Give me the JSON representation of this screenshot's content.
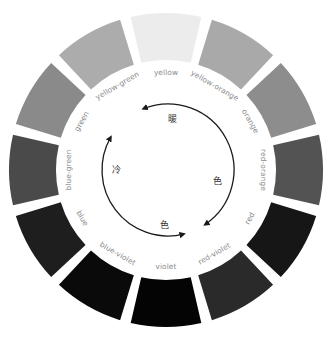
{
  "diagram": {
    "center": [
      166,
      170
    ],
    "outer_radius": 157,
    "inner_radius": 110,
    "label_radius": 97,
    "gap_degrees": 4,
    "segments": [
      {
        "name": "yellow",
        "label": "yellow",
        "color": "#ececec"
      },
      {
        "name": "yellow-orange",
        "label": "yellow-orange",
        "color": "#a9a9a9"
      },
      {
        "name": "orange",
        "label": "orange",
        "color": "#8d8d8d"
      },
      {
        "name": "red-orange",
        "label": "red-orange",
        "color": "#535353"
      },
      {
        "name": "red",
        "label": "red",
        "color": "#161616"
      },
      {
        "name": "red-violet",
        "label": "red-violet",
        "color": "#2a2a2a"
      },
      {
        "name": "violet",
        "label": "violet",
        "color": "#040404"
      },
      {
        "name": "blue-violet",
        "label": "blue-violet",
        "color": "#0a0a0a"
      },
      {
        "name": "blue",
        "label": "blue",
        "color": "#1e1e1e"
      },
      {
        "name": "blue-green",
        "label": "blue-green",
        "color": "#4a4a4a"
      },
      {
        "name": "green",
        "label": "green",
        "color": "#8a8a8a"
      },
      {
        "name": "yellow-green",
        "label": "yellow-green",
        "color": "#acacac"
      }
    ],
    "arrows": {
      "radius": 66,
      "warm": {
        "label_chars": [
          "暖",
          "色"
        ],
        "from_deg": -35,
        "to_deg": 145
      },
      "cool": {
        "label_chars": [
          "冷",
          "色"
        ],
        "from_deg": 160,
        "to_deg": 295
      }
    }
  }
}
